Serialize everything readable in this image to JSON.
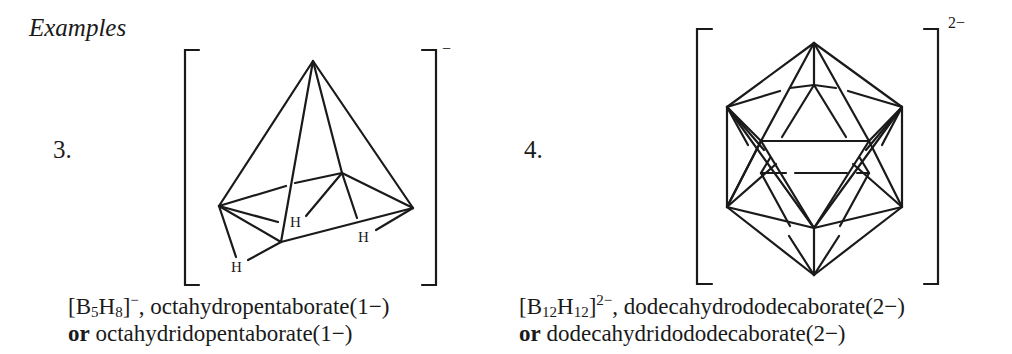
{
  "heading": "Examples",
  "examples": [
    {
      "number": "3.",
      "formula": {
        "open": "[B",
        "b_sub": "5",
        "h": "H",
        "h_sub": "8",
        "close": "]",
        "charge": "−"
      },
      "name_line1": ", octahydropentaborate(1−)",
      "alt_prefix": "or",
      "alt_name": " octahydridopentaborate(1−)",
      "bracket_charge": "−",
      "h_labels": [
        "H",
        "H",
        "H"
      ]
    },
    {
      "number": "4.",
      "formula": {
        "open": "[B",
        "b_sub": "12",
        "h": "H",
        "h_sub": "12",
        "close": "]",
        "charge": "2−"
      },
      "name_line1": ", dodecahydrododecaborate(2−)",
      "alt_prefix": "or",
      "alt_name": " dodecahydridododecaborate(2−)",
      "bracket_charge": "2−"
    }
  ],
  "colors": {
    "ink": "#1a1a1a",
    "background": "#ffffff"
  }
}
